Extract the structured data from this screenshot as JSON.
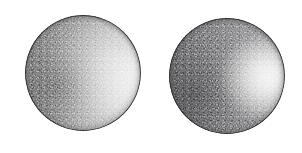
{
  "scene": {
    "title": "Sphere Shading Comparison",
    "width": 302,
    "height": 153,
    "background_color": "#ffffff",
    "object_count": 2,
    "description": "Two shaded gray spheres rendered side by side on a plain white background, each lit from the upper right with a different surface glossiness."
  },
  "palette": {
    "background": "#ffffff",
    "sphere_base": "#a8a8a8",
    "sphere_midtone": "#9a9a9c",
    "sphere_shadow": "#6e6e70",
    "sphere_outline": "#2b2b2d",
    "highlight": "#ffffff"
  },
  "spheres": [
    {
      "label": "left-sphere",
      "caption": "",
      "center_x": 83,
      "center_y": 73,
      "radius": 58,
      "highlight_x_pct": 72,
      "highlight_y_pct": 57,
      "highlight_spread_pct": 46,
      "highlight_intensity": 0.96,
      "finish": "broad diffuse highlight, rougher surface",
      "base_color": "#a9a9a9",
      "shadow_side": "lower-left"
    },
    {
      "label": "right-sphere",
      "caption": "",
      "center_x": 227,
      "center_y": 76,
      "radius": 58,
      "highlight_x_pct": 79,
      "highlight_y_pct": 52,
      "highlight_spread_pct": 27,
      "highlight_intensity": 1.0,
      "finish": "tight concentrated specular highlight, glossier surface",
      "base_color": "#a4a4a6",
      "shadow_side": "lower-left"
    }
  ]
}
